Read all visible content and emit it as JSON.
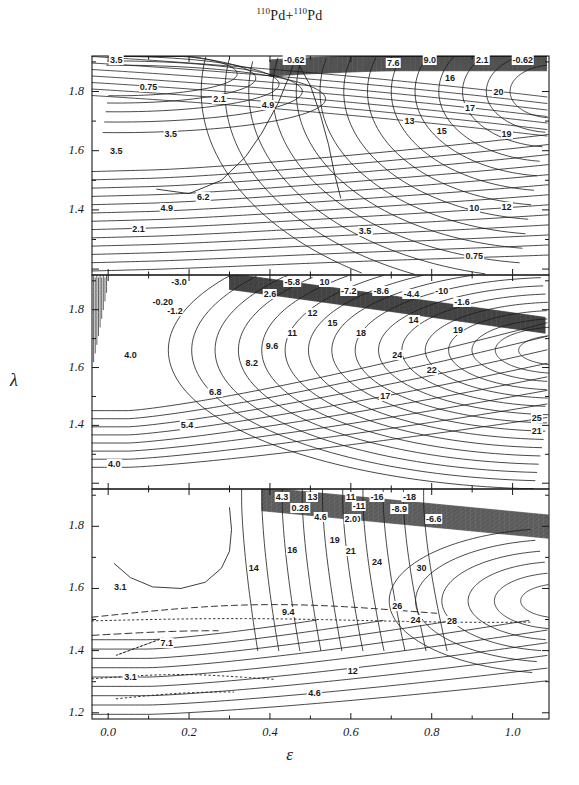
{
  "title": {
    "pre": "110",
    "mid": "Pd+",
    "sup2": "110",
    "post": "Pd",
    "full": "110Pd+110Pd"
  },
  "axes": {
    "xlabel": "ε",
    "ylabel": "λ",
    "xticks": [
      "0.0",
      "0.2",
      "0.4",
      "0.6",
      "0.8",
      "1.0"
    ],
    "xlim": [
      -0.04,
      1.09
    ],
    "yticks": [
      "1.8",
      "1.6",
      "1.4",
      "1.2"
    ],
    "ylim": [
      1.18,
      1.92
    ],
    "minor_ticks": true
  },
  "chart_data": {
    "type": "line",
    "title": "110Pd+110Pd",
    "xlabel": "ε",
    "ylabel": "λ",
    "xlim": [
      -0.04,
      1.09
    ],
    "ylim": [
      1.18,
      1.92
    ],
    "grid": false,
    "legend": "none",
    "panels": [
      {
        "index": 1,
        "ylim": [
          1.18,
          1.92
        ],
        "contour_labels": [
          {
            "text": "3.5",
            "x": 0.02,
            "y": 1.905
          },
          {
            "text": "-0.62",
            "x": 0.46,
            "y": 1.905
          },
          {
            "text": "7.6",
            "x": 0.705,
            "y": 1.895
          },
          {
            "text": "9.0",
            "x": 0.795,
            "y": 1.905
          },
          {
            "text": "2.1",
            "x": 0.925,
            "y": 1.905
          },
          {
            "text": "-0.62",
            "x": 1.025,
            "y": 1.905
          },
          {
            "text": "0.75",
            "x": 0.1,
            "y": 1.815
          },
          {
            "text": "16",
            "x": 0.845,
            "y": 1.845
          },
          {
            "text": "20",
            "x": 0.965,
            "y": 1.8
          },
          {
            "text": "2.1",
            "x": 0.275,
            "y": 1.775
          },
          {
            "text": "4.9",
            "x": 0.395,
            "y": 1.755
          },
          {
            "text": "17",
            "x": 0.895,
            "y": 1.745
          },
          {
            "text": "13",
            "x": 0.745,
            "y": 1.7
          },
          {
            "text": "15",
            "x": 0.825,
            "y": 1.665
          },
          {
            "text": "19",
            "x": 0.985,
            "y": 1.655
          },
          {
            "text": "3.5",
            "x": 0.155,
            "y": 1.655
          },
          {
            "text": "3.5",
            "x": 0.02,
            "y": 1.6
          },
          {
            "text": "6.2",
            "x": 0.235,
            "y": 1.445
          },
          {
            "text": "4.9",
            "x": 0.145,
            "y": 1.405
          },
          {
            "text": "10",
            "x": 0.905,
            "y": 1.405
          },
          {
            "text": "12",
            "x": 0.985,
            "y": 1.41
          },
          {
            "text": "2.1",
            "x": 0.075,
            "y": 1.335
          },
          {
            "text": "3.5",
            "x": 0.635,
            "y": 1.33
          },
          {
            "text": "0.75",
            "x": 0.905,
            "y": 1.245
          }
        ]
      },
      {
        "index": 2,
        "ylim": [
          1.18,
          1.92
        ],
        "contour_labels": [
          {
            "text": "-3.0",
            "x": 0.175,
            "y": 1.895
          },
          {
            "text": "-5.8",
            "x": 0.455,
            "y": 1.895
          },
          {
            "text": "10",
            "x": 0.535,
            "y": 1.895
          },
          {
            "text": "-7.2",
            "x": 0.595,
            "y": 1.865
          },
          {
            "text": "-8.6",
            "x": 0.675,
            "y": 1.865
          },
          {
            "text": "-4.4",
            "x": 0.75,
            "y": 1.855
          },
          {
            "text": "-10",
            "x": 0.825,
            "y": 1.865
          },
          {
            "text": "2.6",
            "x": 0.4,
            "y": 1.855
          },
          {
            "text": "-0.20",
            "x": 0.135,
            "y": 1.825
          },
          {
            "text": "-1.6",
            "x": 0.875,
            "y": 1.825
          },
          {
            "text": "-1.2",
            "x": 0.165,
            "y": 1.795
          },
          {
            "text": "12",
            "x": 0.505,
            "y": 1.79
          },
          {
            "text": "14",
            "x": 0.755,
            "y": 1.765
          },
          {
            "text": "15",
            "x": 0.555,
            "y": 1.755
          },
          {
            "text": "19",
            "x": 0.865,
            "y": 1.73
          },
          {
            "text": "18",
            "x": 0.625,
            "y": 1.72
          },
          {
            "text": "11",
            "x": 0.455,
            "y": 1.72
          },
          {
            "text": "9.6",
            "x": 0.405,
            "y": 1.675
          },
          {
            "text": "4.0",
            "x": 0.055,
            "y": 1.645
          },
          {
            "text": "24",
            "x": 0.715,
            "y": 1.645
          },
          {
            "text": "8.2",
            "x": 0.355,
            "y": 1.615
          },
          {
            "text": "22",
            "x": 0.8,
            "y": 1.59
          },
          {
            "text": "6.8",
            "x": 0.265,
            "y": 1.515
          },
          {
            "text": "17",
            "x": 0.685,
            "y": 1.5
          },
          {
            "text": "25",
            "x": 1.06,
            "y": 1.425
          },
          {
            "text": "5.4",
            "x": 0.195,
            "y": 1.4
          },
          {
            "text": "21",
            "x": 1.06,
            "y": 1.38
          },
          {
            "text": "4.0",
            "x": 0.015,
            "y": 1.265
          }
        ]
      },
      {
        "index": 3,
        "ylim": [
          1.18,
          1.92
        ],
        "contour_labels": [
          {
            "text": "4.3",
            "x": 0.43,
            "y": 1.895
          },
          {
            "text": "13",
            "x": 0.505,
            "y": 1.895
          },
          {
            "text": "11",
            "x": 0.6,
            "y": 1.895
          },
          {
            "text": "-16",
            "x": 0.665,
            "y": 1.895
          },
          {
            "text": "-18",
            "x": 0.745,
            "y": 1.895
          },
          {
            "text": "0.28",
            "x": 0.475,
            "y": 1.86
          },
          {
            "text": "-11",
            "x": 0.62,
            "y": 1.865
          },
          {
            "text": "-8.9",
            "x": 0.72,
            "y": 1.855
          },
          {
            "text": "4.6",
            "x": 0.525,
            "y": 1.83
          },
          {
            "text": "-2.0",
            "x": 0.605,
            "y": 1.825
          },
          {
            "text": "2.0",
            "x": 0.6,
            "y": 1.825
          },
          {
            "text": "-6.6",
            "x": 0.805,
            "y": 1.825
          },
          {
            "text": "19",
            "x": 0.56,
            "y": 1.755
          },
          {
            "text": "16",
            "x": 0.455,
            "y": 1.725
          },
          {
            "text": "21",
            "x": 0.6,
            "y": 1.72
          },
          {
            "text": "24",
            "x": 0.665,
            "y": 1.685
          },
          {
            "text": "30",
            "x": 0.775,
            "y": 1.665
          },
          {
            "text": "14",
            "x": 0.36,
            "y": 1.665
          },
          {
            "text": "3.1",
            "x": 0.03,
            "y": 1.605
          },
          {
            "text": "26",
            "x": 0.715,
            "y": 1.545
          },
          {
            "text": "9.4",
            "x": 0.445,
            "y": 1.525
          },
          {
            "text": "24",
            "x": 0.76,
            "y": 1.5
          },
          {
            "text": "28",
            "x": 0.85,
            "y": 1.495
          },
          {
            "text": "7.1",
            "x": 0.145,
            "y": 1.425
          },
          {
            "text": "12",
            "x": 0.605,
            "y": 1.335
          },
          {
            "text": "3.1",
            "x": 0.055,
            "y": 1.315
          },
          {
            "text": "4.6",
            "x": 0.51,
            "y": 1.265
          }
        ],
        "special_curves": [
          "dashed",
          "dotted"
        ]
      }
    ]
  },
  "style": {
    "line_color": "#1a1a1a",
    "bg": "#ffffff",
    "axis_color": "#1a1a1a"
  }
}
